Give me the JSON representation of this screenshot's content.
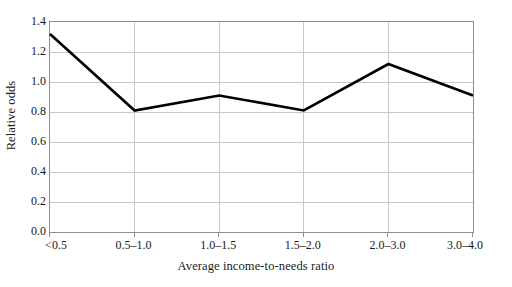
{
  "chart_data": {
    "type": "line",
    "title": "",
    "xlabel": "Average income-to-needs ratio",
    "ylabel": "Relative odds",
    "categories": [
      "<0.5",
      "0.5–1.0",
      "1.0–1.5",
      "1.5–2.0",
      "2.0–3.0",
      "3.0–4.0"
    ],
    "series": [
      {
        "name": "Relative odds",
        "values": [
          1.32,
          0.81,
          0.91,
          0.81,
          1.12,
          0.91
        ],
        "color": "#000000"
      }
    ],
    "ylim": [
      0.0,
      1.4
    ],
    "yticks": [
      0.0,
      0.2,
      0.4,
      0.6,
      0.8,
      1.0,
      1.2,
      1.4
    ],
    "ytick_labels": [
      "0.0",
      "0.2",
      "0.4",
      "0.6",
      "0.8",
      "1.0",
      "1.2",
      "1.4"
    ],
    "grid": {
      "horizontal": true,
      "vertical": true,
      "color": "#c8c8c8"
    },
    "legend": {
      "visible": false,
      "position": "none"
    },
    "axes": {
      "frame_color": "#8c8c8c",
      "background": "#ffffff"
    }
  }
}
